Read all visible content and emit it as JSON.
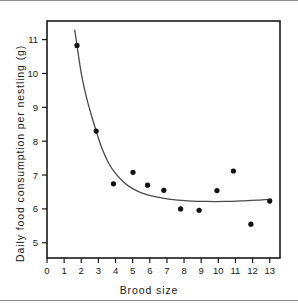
{
  "figure": {
    "name": "brood-size-food-consumption-figure",
    "background": "#ffffff",
    "rule_color": "#8d8d8d",
    "ink_color": "#1a1a1a"
  },
  "chart_data": {
    "type": "scatter",
    "title": "",
    "subtitle": "",
    "xlabel": "Brood size",
    "ylabel": "Daily food consumption per nestling (g)",
    "xlim": [
      0,
      13.6
    ],
    "ylim": [
      4.55,
      11.55
    ],
    "xticks": [
      0,
      1,
      2,
      3,
      4,
      5,
      6,
      7,
      8,
      9,
      10,
      11,
      12,
      13
    ],
    "xticklabels": [
      "0",
      "1",
      "2",
      "3",
      "4",
      "5",
      "6",
      "7",
      "8",
      "9",
      "10",
      "11",
      "12",
      "13"
    ],
    "yticks": [
      5,
      6,
      7,
      8,
      9,
      10,
      11
    ],
    "yticklabels": [
      "5",
      "6",
      "7",
      "8",
      "9",
      "10",
      "11"
    ],
    "grid": false,
    "legend": null,
    "legend_position": "none",
    "tick_direction": "out",
    "frame": "box",
    "marker": "filled-circle",
    "marker_color": "#111111",
    "marker_size_px": 5.2,
    "series": [
      {
        "name": "Daily food consumption per nestling",
        "marker": "filled-circle",
        "color": "#111111",
        "points": [
          {
            "x": 1.75,
            "y": 10.83
          },
          {
            "x": 2.87,
            "y": 8.3
          },
          {
            "x": 3.88,
            "y": 6.74
          },
          {
            "x": 5.02,
            "y": 7.08
          },
          {
            "x": 5.87,
            "y": 6.7
          },
          {
            "x": 6.82,
            "y": 6.55
          },
          {
            "x": 7.8,
            "y": 6.0
          },
          {
            "x": 8.88,
            "y": 5.96
          },
          {
            "x": 9.92,
            "y": 6.54
          },
          {
            "x": 10.88,
            "y": 7.12
          },
          {
            "x": 11.9,
            "y": 5.55
          },
          {
            "x": 13.0,
            "y": 6.23
          }
        ]
      }
    ],
    "fit_curve": {
      "name": "fitted-decay-curve",
      "color": "#4a4a4a",
      "width_px": 1.3,
      "description": "Monotonic decreasing curve approaching an asymptote near 6.3 g",
      "points": [
        {
          "x": 1.62,
          "y": 11.28
        },
        {
          "x": 1.75,
          "y": 10.83
        },
        {
          "x": 2.0,
          "y": 10.0
        },
        {
          "x": 2.3,
          "y": 9.3
        },
        {
          "x": 2.6,
          "y": 8.75
        },
        {
          "x": 2.87,
          "y": 8.3
        },
        {
          "x": 3.2,
          "y": 7.8
        },
        {
          "x": 3.6,
          "y": 7.35
        },
        {
          "x": 4.0,
          "y": 7.05
        },
        {
          "x": 4.5,
          "y": 6.78
        },
        {
          "x": 5.0,
          "y": 6.6
        },
        {
          "x": 5.6,
          "y": 6.46
        },
        {
          "x": 6.3,
          "y": 6.36
        },
        {
          "x": 7.2,
          "y": 6.28
        },
        {
          "x": 8.2,
          "y": 6.24
        },
        {
          "x": 9.3,
          "y": 6.22
        },
        {
          "x": 10.4,
          "y": 6.22
        },
        {
          "x": 11.5,
          "y": 6.24
        },
        {
          "x": 12.3,
          "y": 6.26
        },
        {
          "x": 13.1,
          "y": 6.29
        }
      ]
    }
  }
}
